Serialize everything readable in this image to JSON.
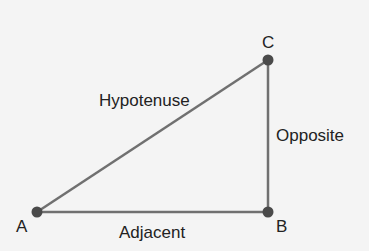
{
  "diagram": {
    "colors": {
      "background": "#f4f4f4",
      "line": "#707070",
      "point": "#4a4a4a",
      "text": "#222222"
    },
    "vertices": [
      {
        "name": "A",
        "x": 37,
        "y": 212
      },
      {
        "name": "B",
        "x": 268,
        "y": 212
      },
      {
        "name": "C",
        "x": 268,
        "y": 60
      }
    ],
    "vertex_labels": {
      "A": "A",
      "B": "B",
      "C": "C"
    },
    "side_labels": {
      "hypotenuse": "Hypotenuse",
      "opposite": "Opposite",
      "adjacent": "Adjacent"
    }
  }
}
